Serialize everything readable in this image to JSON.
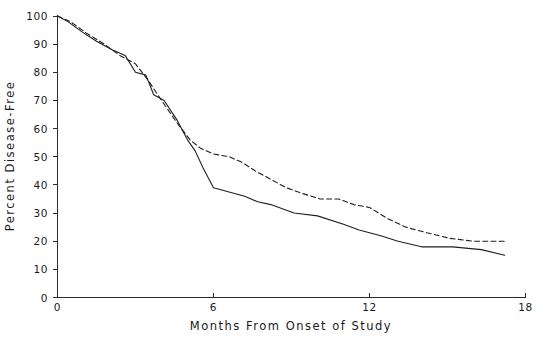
{
  "chart_data": {
    "type": "line",
    "title": "",
    "xlabel": "Months From Onset of Study",
    "ylabel": "Percent Disease-Free",
    "xlim": [
      0,
      18
    ],
    "ylim": [
      0,
      100
    ],
    "xticks": [
      0,
      6,
      12,
      18
    ],
    "xtick_labels": [
      "0",
      "6",
      "12",
      "18"
    ],
    "yticks": [
      0,
      10,
      20,
      30,
      40,
      50,
      60,
      70,
      80,
      90,
      100
    ],
    "ytick_labels": [
      "0",
      "10",
      "20",
      "30",
      "40",
      "50",
      "60",
      "70",
      "80",
      "90",
      "100"
    ],
    "grid": false,
    "legend": null,
    "legend_position": "none",
    "series": [
      {
        "name": "solid-curve",
        "style": "solid",
        "color": "#1f1f1f",
        "x": [
          0.0,
          0.4,
          1.0,
          1.5,
          2.1,
          2.6,
          3.0,
          3.4,
          3.7,
          4.1,
          4.6,
          5.0,
          5.3,
          5.6,
          6.0,
          7.2,
          7.7,
          8.2,
          9.1,
          10.0,
          11.0,
          11.6,
          12.4,
          13.1,
          14.0,
          15.2,
          16.3,
          17.2
        ],
        "y": [
          100,
          98,
          94,
          91,
          88,
          86,
          80,
          79,
          72,
          70,
          63,
          56,
          52,
          46,
          39,
          36,
          34,
          33,
          30,
          29,
          26,
          24,
          22,
          20,
          18,
          18,
          17,
          15
        ]
      },
      {
        "name": "dashed-curve",
        "style": "dashed",
        "color": "#1f1f1f",
        "x": [
          0.0,
          0.5,
          1.1,
          1.8,
          2.4,
          3.0,
          3.5,
          4.0,
          4.6,
          5.1,
          5.5,
          6.0,
          6.6,
          7.1,
          7.6,
          8.2,
          8.8,
          9.4,
          10.1,
          10.8,
          11.4,
          12.0,
          12.7,
          13.4,
          14.2,
          15.1,
          16.0,
          17.2
        ],
        "y": [
          100,
          98,
          94,
          90,
          86,
          83,
          77,
          70,
          62,
          56,
          53,
          51,
          50,
          48,
          45,
          42,
          39,
          37,
          35,
          35,
          33,
          32,
          28,
          25,
          23,
          21,
          20,
          20
        ]
      }
    ]
  },
  "axes": {
    "y_label_text": "Percent Disease-Free",
    "x_label_text": "Months From Onset of Study"
  }
}
